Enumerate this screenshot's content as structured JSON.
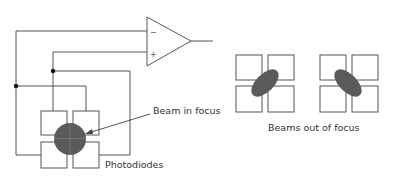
{
  "diagram": {
    "type": "optical-focus-detection-circuit",
    "amplifier": {
      "inverting_input_label": "−",
      "noninverting_input_label": "+"
    },
    "labels": {
      "beam_in_focus": "Beam in focus",
      "photodiodes": "Photodiodes",
      "beams_out_of_focus": "Beams out of focus"
    },
    "colors": {
      "line": "#555555",
      "beam": "#5a5a5a",
      "junction": "#111111",
      "square_border": "#555555"
    }
  }
}
